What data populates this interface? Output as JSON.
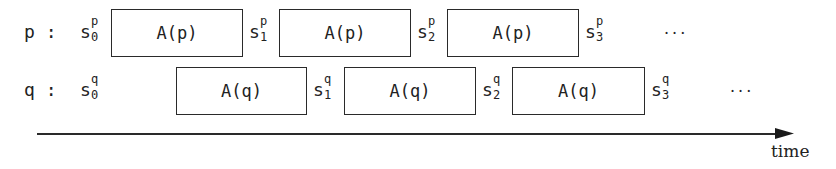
{
  "diagram": {
    "type": "process timing diagram",
    "rows": [
      {
        "process_label": "p :",
        "action_label": "A(p)",
        "states": [
          {
            "base": "s",
            "sub": "0",
            "sup": "p"
          },
          {
            "base": "s",
            "sub": "1",
            "sup": "p"
          },
          {
            "base": "s",
            "sub": "2",
            "sup": "p"
          },
          {
            "base": "s",
            "sub": "3",
            "sup": "p"
          }
        ],
        "boxes": [
          "A(p)",
          "A(p)",
          "A(p)"
        ],
        "ellipsis": "···"
      },
      {
        "process_label": "q :",
        "action_label": "A(q)",
        "states": [
          {
            "base": "s",
            "sub": "0",
            "sup": "q"
          },
          {
            "base": "s",
            "sub": "1",
            "sup": "q"
          },
          {
            "base": "s",
            "sub": "2",
            "sup": "q"
          },
          {
            "base": "s",
            "sub": "3",
            "sup": "q"
          }
        ],
        "boxes": [
          "A(q)",
          "A(q)",
          "A(q)"
        ],
        "ellipsis": "···"
      }
    ],
    "axis": {
      "label": "time",
      "direction": "right"
    },
    "colors": {
      "ink": "#222222",
      "background": "#ffffff"
    }
  }
}
